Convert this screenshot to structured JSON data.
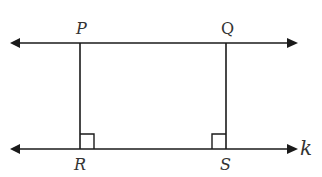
{
  "diagram": {
    "points": {
      "P": "P",
      "Q": "Q",
      "R": "R",
      "S": "S"
    },
    "line_label": "k",
    "line_color": "#1a1a1a",
    "right_angles": [
      "R",
      "S"
    ]
  }
}
